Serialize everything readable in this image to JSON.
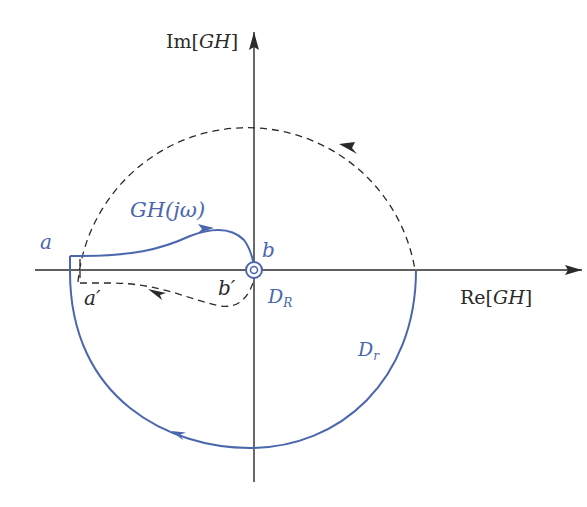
{
  "diagram": {
    "type": "nyquist-contour-mapping",
    "colors": {
      "axis": "#2a2a2a",
      "contour": "#4a66ad",
      "dashed": "#2a2a2a"
    },
    "axes": {
      "imag_label_prefix": "Im[",
      "imag_label_var": "GH",
      "imag_label_suffix": "]",
      "real_label_prefix": "Re[",
      "real_label_var": "GH",
      "real_label_suffix": "]"
    },
    "labels": {
      "gh_curve": "GH(jω)",
      "point_a": "a",
      "point_a_prime": "a′",
      "point_b": "b",
      "point_b_prime": "b′",
      "dr_main": "D",
      "dr_sub": "R",
      "dr_circle_main": "D",
      "dr_circle_sub": "r"
    }
  }
}
